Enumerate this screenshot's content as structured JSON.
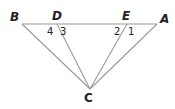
{
  "diagram": {
    "points": {
      "B": {
        "label": "B",
        "x": 22,
        "y": 24
      },
      "D": {
        "label": "D",
        "x": 57,
        "y": 24
      },
      "E": {
        "label": "E",
        "x": 127,
        "y": 24
      },
      "A": {
        "label": "A",
        "x": 157,
        "y": 24
      },
      "C": {
        "label": "C",
        "x": 90,
        "y": 89
      }
    },
    "segments": [
      "BA",
      "BC",
      "DC",
      "EC",
      "AC"
    ],
    "angle_labels": {
      "a4": "4",
      "a3": "3",
      "a2": "2",
      "a1": "1"
    },
    "line_color": "#9a9a9a",
    "text_color": "#222222"
  }
}
